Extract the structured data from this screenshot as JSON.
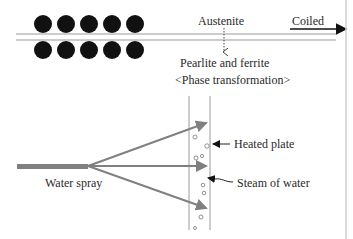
{
  "labels": {
    "austenite": "Austenite",
    "coiled": "Coiled",
    "pearlite": "Pearlite and ferrite",
    "phase": "<Phase transformation>",
    "heated_plate": "Heated plate",
    "steam": "Steam of water",
    "water_spray": "Water spray"
  },
  "colors": {
    "roll": "#111111",
    "line": "#9a9a9a",
    "spray": "#808080",
    "text": "#2a2a2a"
  }
}
